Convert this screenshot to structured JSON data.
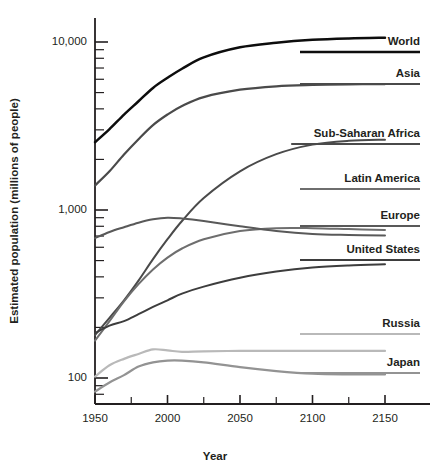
{
  "chart_data": {
    "type": "line",
    "title": "",
    "xlabel": "Year",
    "ylabel": "Estimated population (millions of people)",
    "yscale": "log",
    "ylim": [
      60,
      20000
    ],
    "xlim": [
      1950,
      2150
    ],
    "grid": false,
    "legend_position": "right-inline-labels",
    "x_ticks": [
      1950,
      2000,
      2050,
      2100,
      2150
    ],
    "x_minor_ticks": [
      1975,
      2025,
      2075,
      2125
    ],
    "y_ticks": [
      100,
      1000,
      10000
    ],
    "y_tick_labels": [
      "100",
      "1,000",
      "10,000"
    ],
    "y_minor_ticks": [
      70,
      80,
      90,
      200,
      300,
      400,
      500,
      600,
      700,
      800,
      900,
      2000,
      3000,
      4000,
      5000,
      6000,
      7000,
      8000,
      9000,
      20000
    ],
    "x": [
      1950,
      1960,
      1970,
      1980,
      1990,
      2000,
      2010,
      2025,
      2050,
      2075,
      2100,
      2125,
      2150
    ],
    "series": [
      {
        "name": "World",
        "label": "World",
        "color": "#0d0d0d",
        "width": 2.5,
        "values": [
          2530,
          3030,
          3700,
          4440,
          5330,
          6120,
          6930,
          8100,
          9300,
          9900,
          10300,
          10500,
          10600
        ]
      },
      {
        "name": "Asia",
        "label": "Asia",
        "color": "#4a4a4a",
        "width": 2.2,
        "values": [
          1400,
          1700,
          2140,
          2640,
          3200,
          3700,
          4160,
          4700,
          5200,
          5450,
          5550,
          5600,
          5620
        ]
      },
      {
        "name": "Sub-Saharan Africa",
        "label": "Sub-Saharan Africa",
        "color": "#4a4a4a",
        "width": 2.0,
        "values": [
          180,
          228,
          290,
          380,
          510,
          670,
          860,
          1180,
          1700,
          2150,
          2450,
          2580,
          2620
        ]
      },
      {
        "name": "Latin America",
        "label": "Latin America",
        "color": "#6e6e6e",
        "width": 2.0,
        "values": [
          167,
          218,
          286,
          362,
          443,
          521,
          590,
          670,
          750,
          780,
          780,
          770,
          760
        ]
      },
      {
        "name": "Europe",
        "label": "Europe",
        "color": "#595959",
        "width": 2.0,
        "values": [
          680,
          740,
          790,
          840,
          880,
          900,
          890,
          860,
          800,
          750,
          720,
          710,
          705
        ]
      },
      {
        "name": "United States",
        "label": "United States",
        "color": "#3d3d3d",
        "width": 2.0,
        "values": [
          185,
          205,
          218,
          240,
          265,
          290,
          318,
          350,
          395,
          430,
          455,
          468,
          475
        ]
      },
      {
        "name": "Russia",
        "label": "Russia",
        "color": "#b9b9b9",
        "width": 2.2,
        "values": [
          102,
          119,
          130,
          139,
          148,
          146,
          143,
          144,
          145,
          145,
          145,
          145,
          145
        ]
      },
      {
        "name": "Japan",
        "label": "Japan",
        "color": "#939393",
        "width": 2.2,
        "values": [
          83,
          94,
          104,
          117,
          124,
          127,
          127,
          124,
          116,
          110,
          106,
          105,
          105
        ]
      }
    ],
    "label_anchors": [
      {
        "name": "World",
        "text_y": 45,
        "rule_y": 52,
        "color": "#0d0d0d",
        "width": 2.4
      },
      {
        "name": "Asia",
        "text_y": 77,
        "rule_y": 84,
        "color": "#4a4a4a",
        "width": 2.1
      },
      {
        "name": "Sub-Saharan Africa",
        "text_y": 137,
        "rule_y": 144,
        "color": "#4a4a4a",
        "width": 2.0
      },
      {
        "name": "Latin America",
        "text_y": 182,
        "rule_y": 189,
        "color": "#6e6e6e",
        "width": 2.0
      },
      {
        "name": "Europe",
        "text_y": 219,
        "rule_y": 226,
        "color": "#595959",
        "width": 2.0
      },
      {
        "name": "United States",
        "text_y": 253,
        "rule_y": 260,
        "color": "#3d3d3d",
        "width": 2.0
      },
      {
        "name": "Russia",
        "text_y": 327,
        "rule_y": 334,
        "color": "#b9b9b9",
        "width": 2.2
      },
      {
        "name": "Japan",
        "text_y": 366,
        "rule_y": 373,
        "color": "#939393",
        "width": 2.2
      }
    ]
  },
  "axes": {
    "x_title": "Year",
    "y_title": "Estimated population (millions of people)"
  }
}
